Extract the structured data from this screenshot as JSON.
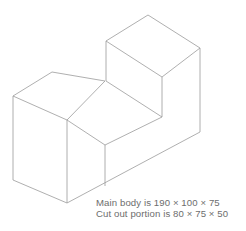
{
  "figure": {
    "name": "isometric-block-with-notch",
    "line_color": "#9a9a9a",
    "face_color": "#ffffff",
    "background_color": "#ffffff",
    "text_color": "#6d6d6d"
  },
  "caption": {
    "line1": "Main body is 190 × 100 × 75",
    "line2": "Cut out portion is 80 × 75 × 50"
  },
  "dimensions": {
    "main_body": {
      "label": "Main body",
      "length": 190,
      "width": 100,
      "height": 75,
      "text": "190 × 100 × 75"
    },
    "cut_out": {
      "label": "Cut out portion",
      "length": 80,
      "width": 75,
      "height": 50,
      "text": "80 × 75 × 50"
    }
  }
}
